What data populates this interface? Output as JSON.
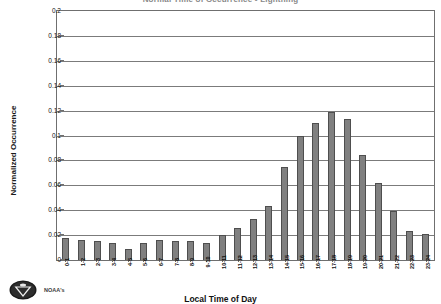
{
  "chart_data": {
    "type": "bar",
    "title": "Normal Time of Occurrence - Lightning",
    "annotation": "*Data from 1980-2010",
    "xlabel": "Local Time of Day",
    "ylabel": "Normalized Occurrence",
    "ylim": [
      0,
      0.2
    ],
    "ytick_step": 0.02,
    "ytick_labels": [
      "0.2",
      "0.18",
      "0.16",
      "0.14",
      "0.12",
      "0.1",
      "0.08",
      "0.06",
      "0.04",
      "0.02",
      "0"
    ],
    "ytick_values": [
      0.2,
      0.18,
      0.16,
      0.14,
      0.12,
      0.1,
      0.08,
      0.06,
      0.04,
      0.02,
      0
    ],
    "grid": true,
    "legend": "none",
    "bar_color": "#808080",
    "bar_edge_color": "#4e4e4e",
    "categories": [
      "0-1",
      "1-2",
      "2-3",
      "3-4",
      "4-5",
      "5-6",
      "6-7",
      "7-8",
      "8-9",
      "9-10",
      "10-11",
      "11-12",
      "12-13",
      "13-14",
      "14-15",
      "15-16",
      "16-17",
      "17-18",
      "18-19",
      "19-20",
      "20-21",
      "21-22",
      "22-23",
      "23-24"
    ],
    "values": [
      0.018,
      0.016,
      0.015,
      0.014,
      0.009,
      0.014,
      0.016,
      0.015,
      0.015,
      0.014,
      0.02,
      0.026,
      0.033,
      0.043,
      0.075,
      0.1,
      0.11,
      0.119,
      0.113,
      0.084,
      0.062,
      0.039,
      0.023,
      0.021
    ]
  },
  "footer": {
    "credit": "NOAA's",
    "logo_name": "noaa-logo"
  }
}
